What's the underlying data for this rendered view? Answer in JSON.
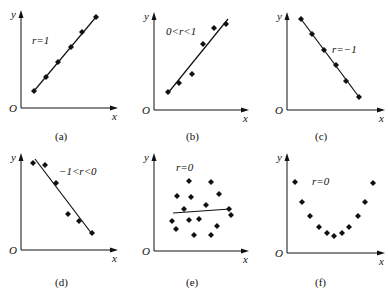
{
  "chart_data": [
    {
      "id": "a",
      "type": "scatter",
      "caption": "(a)",
      "annotation": "r=1",
      "xlabel": "x",
      "ylabel": "y",
      "origin_label": "O",
      "axis": {
        "ox": 21,
        "oy": 108,
        "xend": 118,
        "ytop": 10
      },
      "points": [
        [
          34,
          91
        ],
        [
          46,
          77
        ],
        [
          58,
          62
        ],
        [
          71,
          47
        ],
        [
          82,
          32
        ],
        [
          96,
          17
        ]
      ],
      "fit_line": [
        [
          34,
          91
        ],
        [
          96,
          17
        ]
      ],
      "label_pos": [
        32,
        44
      ],
      "caption_pos": [
        55,
        140
      ]
    },
    {
      "id": "b",
      "type": "scatter",
      "caption": "(b)",
      "annotation": "0<r<1",
      "xlabel": "x",
      "ylabel": "y",
      "origin_label": "O",
      "axis": {
        "ox": 154,
        "oy": 110,
        "xend": 249,
        "ytop": 12
      },
      "points": [
        [
          168,
          92
        ],
        [
          179,
          83
        ],
        [
          192,
          74
        ],
        [
          203,
          44
        ],
        [
          214,
          28
        ],
        [
          226,
          24
        ]
      ],
      "fit_line": [
        [
          168,
          93
        ],
        [
          228,
          19
        ]
      ],
      "label_pos": [
        166,
        35
      ],
      "caption_pos": [
        186,
        140
      ]
    },
    {
      "id": "c",
      "type": "scatter",
      "caption": "(c)",
      "annotation": "r=−1",
      "xlabel": "x",
      "ylabel": "y",
      "origin_label": "O",
      "axis": {
        "ox": 287,
        "oy": 110,
        "xend": 385,
        "ytop": 12
      },
      "points": [
        [
          301,
          19
        ],
        [
          312,
          34
        ],
        [
          324,
          50
        ],
        [
          336,
          65
        ],
        [
          346,
          81
        ],
        [
          359,
          97
        ]
      ],
      "fit_line": [
        [
          301,
          19
        ],
        [
          359,
          97
        ]
      ],
      "label_pos": [
        332,
        53
      ],
      "caption_pos": [
        315,
        140
      ]
    },
    {
      "id": "d",
      "type": "scatter",
      "caption": "(d)",
      "annotation": "−1<r<0",
      "xlabel": "x",
      "ylabel": "y",
      "origin_label": "O",
      "axis": {
        "ox": 21,
        "oy": 250,
        "xend": 118,
        "ytop": 153
      },
      "points": [
        [
          33,
          163
        ],
        [
          45,
          165
        ],
        [
          56,
          183
        ],
        [
          68,
          214
        ],
        [
          79,
          221
        ],
        [
          92,
          233
        ]
      ],
      "fit_line": [
        [
          35,
          159
        ],
        [
          92,
          234
        ]
      ],
      "label_pos": [
        59,
        175
      ],
      "caption_pos": [
        55,
        286
      ]
    },
    {
      "id": "e",
      "type": "scatter",
      "caption": "(e)",
      "annotation": "r=0",
      "xlabel": "x",
      "ylabel": "y",
      "origin_label": "O",
      "axis": {
        "ox": 154,
        "oy": 251,
        "xend": 249,
        "ytop": 153
      },
      "points": [
        [
          189,
          181
        ],
        [
          211,
          182
        ],
        [
          177,
          196
        ],
        [
          191,
          197
        ],
        [
          219,
          194
        ],
        [
          184,
          209
        ],
        [
          206,
          205
        ],
        [
          229,
          209
        ],
        [
          231,
          215
        ],
        [
          172,
          221
        ],
        [
          189,
          220
        ],
        [
          199,
          219
        ],
        [
          176,
          229
        ],
        [
          217,
          226
        ],
        [
          194,
          235
        ],
        [
          211,
          235
        ]
      ],
      "fit_line": [
        [
          173,
          213
        ],
        [
          230,
          209
        ]
      ],
      "label_pos": [
        176,
        171
      ],
      "caption_pos": [
        186,
        286
      ]
    },
    {
      "id": "f",
      "type": "scatter",
      "caption": "(f)",
      "annotation": "r=0",
      "xlabel": "x",
      "ylabel": "y",
      "origin_label": "O",
      "axis": {
        "ox": 287,
        "oy": 253,
        "xend": 385,
        "ytop": 153
      },
      "points": [
        [
          295,
          182
        ],
        [
          302,
          202
        ],
        [
          310,
          216
        ],
        [
          319,
          227
        ],
        [
          327,
          233
        ],
        [
          334,
          236
        ],
        [
          342,
          233
        ],
        [
          349,
          227
        ],
        [
          358,
          216
        ],
        [
          365,
          202
        ],
        [
          373,
          183
        ]
      ],
      "fit_line": null,
      "label_pos": [
        312,
        185
      ],
      "caption_pos": [
        315,
        286
      ]
    }
  ]
}
